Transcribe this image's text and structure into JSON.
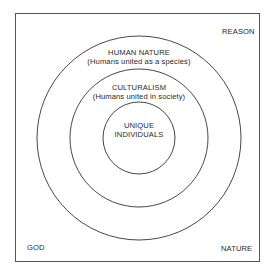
{
  "diagram": {
    "type": "concentric-circles",
    "corners": {
      "top_right": "REASON",
      "bottom_left": "GOD",
      "bottom_right": "NATURE"
    },
    "rings": [
      {
        "title": "HUMAN NATURE",
        "subtitle": "(Humans united as a species)"
      },
      {
        "title": "CULTURALISM",
        "subtitle": "(Humans united in society)"
      },
      {
        "title": "UNIQUE",
        "subtitle": "INDIVIDUALS"
      }
    ],
    "colors": {
      "stroke": "#333333",
      "text": "#2a2a2a",
      "background": "#ffffff"
    }
  }
}
